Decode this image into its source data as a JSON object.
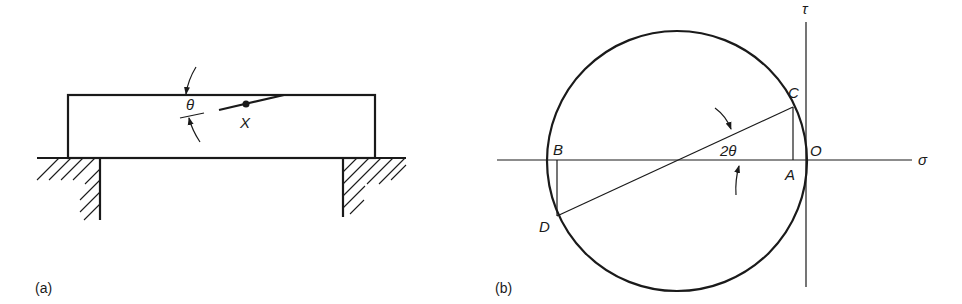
{
  "figure_a": {
    "caption": "(a)",
    "angle_label": "θ",
    "point_label": "X"
  },
  "figure_b": {
    "caption": "(b)",
    "axis_vertical_label": "τ",
    "axis_horizontal_label": "σ",
    "point_labels": {
      "A": "A",
      "B": "B",
      "C": "C",
      "D": "D",
      "O": "O"
    },
    "angle_label": "2θ"
  }
}
